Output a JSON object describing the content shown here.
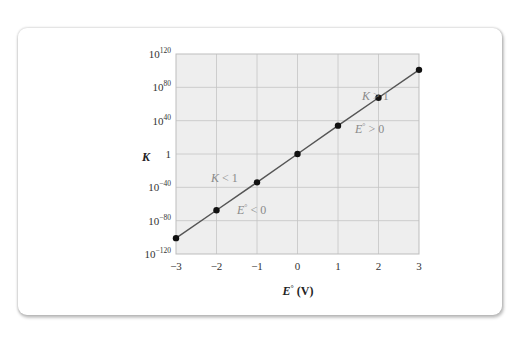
{
  "chart_data": {
    "type": "line",
    "title": "",
    "xlabel": "E° (V)",
    "xlabel_parts": {
      "symbol": "E",
      "degree": "°",
      "unit": " (V)"
    },
    "ylabel": "K",
    "yscale": "log",
    "xlim": [
      -3,
      3
    ],
    "ylim_log10": [
      -120,
      120
    ],
    "grid": true,
    "x_ticks": [
      "−3",
      "−2",
      "−1",
      "0",
      "1",
      "2",
      "3"
    ],
    "x_tick_values": [
      -3,
      -2,
      -1,
      0,
      1,
      2,
      3
    ],
    "y_ticks": [
      {
        "exp": 120,
        "base": "10",
        "sup": "120"
      },
      {
        "exp": 80,
        "base": "10",
        "sup": "80"
      },
      {
        "exp": 40,
        "base": "10",
        "sup": "40"
      },
      {
        "exp": 0,
        "base": "1",
        "sup": ""
      },
      {
        "exp": -40,
        "base": "10",
        "sup": "−40"
      },
      {
        "exp": -80,
        "base": "10",
        "sup": "−80"
      },
      {
        "exp": -120,
        "base": "10",
        "sup": "−120"
      }
    ],
    "series": [
      {
        "name": "K vs E°",
        "x": [
          -3,
          -2,
          -1,
          0,
          1,
          2,
          3
        ],
        "log10_y": [
          -101,
          -67.5,
          -34,
          0,
          34,
          67.5,
          101
        ],
        "color": "#555555",
        "marker": "circle"
      }
    ],
    "annotations": [
      {
        "text_main": "K > 1",
        "region": "upper-right"
      },
      {
        "text_main": "E° > 0",
        "region": "upper-right"
      },
      {
        "text_main": "K < 1",
        "region": "lower-left"
      },
      {
        "text_main": "E° < 0",
        "region": "lower-left"
      }
    ]
  },
  "colors": {
    "plot_bg": "#eeeeee",
    "grid": "#c4c4c4",
    "frame": "#bdbdbd",
    "line": "#555555",
    "marker": "#111111"
  }
}
